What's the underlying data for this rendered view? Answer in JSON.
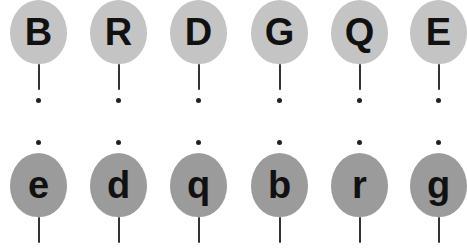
{
  "activity": "Match uppercase and lowercase letters",
  "colors": {
    "upper_balloon": "#c4c4c4",
    "lower_balloon": "#9b9b9b",
    "letter": "#111111",
    "string": "#333333",
    "dot": "#222222"
  },
  "upper_row": [
    {
      "letter": "B"
    },
    {
      "letter": "R"
    },
    {
      "letter": "D"
    },
    {
      "letter": "G"
    },
    {
      "letter": "Q"
    },
    {
      "letter": "E"
    }
  ],
  "lower_row": [
    {
      "letter": "e"
    },
    {
      "letter": "d"
    },
    {
      "letter": "q"
    },
    {
      "letter": "b"
    },
    {
      "letter": "r"
    },
    {
      "letter": "g"
    }
  ]
}
